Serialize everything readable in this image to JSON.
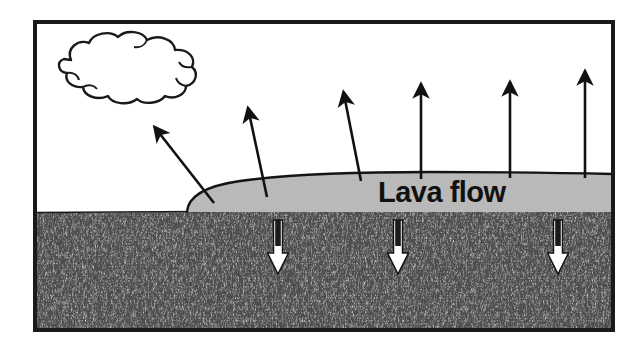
{
  "figure": {
    "kind": "cross-section-diagram",
    "title_text": "Lava flow",
    "frame": {
      "x": 33,
      "y": 20,
      "width": 582,
      "height": 312,
      "border_color": "#1a1a1a",
      "border_width": 4
    },
    "colors": {
      "sky": "#ffffff",
      "ground_base": "#4a4a4a",
      "ground_speckle_light": "#b9b9b9",
      "ground_speckle_dark": "#222222",
      "lava": "#b6b6b6",
      "outline": "#111111",
      "arrow_up": "#111111",
      "arrow_down_fill": "#ffffff",
      "arrow_down_stroke": "#111111",
      "label_text": "#111111",
      "cloud_fill": "#ffffff",
      "cloud_stroke": "#1a1a1a"
    },
    "regions": [
      {
        "name": "sky",
        "label": "sky",
        "description": "white area above ground line"
      },
      {
        "name": "ground",
        "label": "ground",
        "description": "dark mottled rock texture below ground line",
        "top_y": 212
      },
      {
        "name": "lava-flow",
        "label": "Lava flow",
        "description": "light gray lens-shaped lava sheet resting on the ground surface",
        "left_x": 187,
        "right_x": 611,
        "crest_y": 176
      }
    ],
    "cloud": {
      "name": "cloud",
      "label": "cloud",
      "cx": 124,
      "cy": 67,
      "rx": 76,
      "ry": 33
    },
    "arrows_up": [
      {
        "id": "up-1",
        "label": "heat escaping toward cloud",
        "x1": 214,
        "y1": 203,
        "x2": 152,
        "y2": 124
      },
      {
        "id": "up-2",
        "label": "heat escaping",
        "x1": 267,
        "y1": 197,
        "x2": 247,
        "y2": 104
      },
      {
        "id": "up-3",
        "label": "heat escaping",
        "x1": 361,
        "y1": 181,
        "x2": 342,
        "y2": 87
      },
      {
        "id": "up-4",
        "label": "heat escaping",
        "x1": 421,
        "y1": 179,
        "x2": 421,
        "y2": 79
      },
      {
        "id": "up-5",
        "label": "heat escaping",
        "x1": 510,
        "y1": 178,
        "x2": 510,
        "y2": 77
      },
      {
        "id": "up-6",
        "label": "heat escaping",
        "x1": 585,
        "y1": 178,
        "x2": 585,
        "y2": 66
      }
    ],
    "arrows_down": [
      {
        "id": "down-1",
        "label": "heat conducted into ground",
        "x": 278,
        "y1": 221,
        "y2": 272
      },
      {
        "id": "down-2",
        "label": "heat conducted into ground",
        "x": 398,
        "y1": 221,
        "y2": 272
      },
      {
        "id": "down-3",
        "label": "heat conducted into ground",
        "x": 558,
        "y1": 221,
        "y2": 272
      }
    ]
  }
}
